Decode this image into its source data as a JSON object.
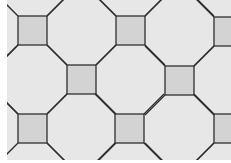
{
  "pattern": {
    "name": "octagon-square tiling",
    "colors": {
      "page": "#ffffff",
      "background": "#e7e7e7",
      "square_fill": "#d3d3d3",
      "line": "#2e2e2e"
    },
    "area": {
      "x": 7,
      "y": 0,
      "width": 224,
      "height": 160
    },
    "square_size": 29,
    "squares": [
      {
        "x": 18,
        "y": 16
      },
      {
        "x": 116,
        "y": 16
      },
      {
        "x": 214,
        "y": 17
      },
      {
        "x": 67,
        "y": 65
      },
      {
        "x": 165,
        "y": 66
      },
      {
        "x": -31,
        "y": 65
      },
      {
        "x": 18,
        "y": 114
      },
      {
        "x": 115,
        "y": 114
      },
      {
        "x": 214,
        "y": 114
      },
      {
        "x": 67,
        "y": 163
      },
      {
        "x": 165,
        "y": 163
      },
      {
        "x": 67,
        "y": -33
      },
      {
        "x": 165,
        "y": -33
      }
    ]
  }
}
